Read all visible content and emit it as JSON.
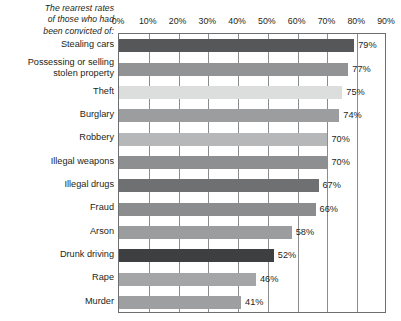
{
  "caption": {
    "line1": "The rearrest rates",
    "line2": "of those who had",
    "line3": "been convicted of:"
  },
  "chart_data": {
    "type": "bar",
    "orientation": "horizontal",
    "title": "The rearrest rates of those who had been convicted of:",
    "xlabel": "",
    "ylabel": "",
    "xlim": [
      0,
      90
    ],
    "xticks": [
      "0%",
      "10%",
      "20%",
      "30%",
      "40%",
      "50%",
      "60%",
      "70%",
      "80%",
      "90%"
    ],
    "xtick_values": [
      0,
      10,
      20,
      30,
      40,
      50,
      60,
      70,
      80,
      90
    ],
    "grid": true,
    "legend": "none",
    "categories": [
      "Stealing cars",
      "Possessing or selling stolen property",
      "Theft",
      "Burglary",
      "Robbery",
      "Illegal weapons",
      "Illegal drugs",
      "Fraud",
      "Arson",
      "Drunk driving",
      "Rape",
      "Murder"
    ],
    "values": [
      79,
      77,
      75,
      74,
      70,
      70,
      67,
      66,
      58,
      52,
      46,
      41
    ],
    "value_labels": [
      "79%",
      "77%",
      "75%",
      "74%",
      "70%",
      "70%",
      "67%",
      "66%",
      "58%",
      "52%",
      "46%",
      "41%"
    ],
    "bars": [
      {
        "label": "Stealing cars",
        "label_lines": [
          "Stealing cars"
        ],
        "value": 79,
        "value_label": "79%",
        "color": "#555759"
      },
      {
        "label": "Possessing or selling stolen property",
        "label_lines": [
          "Possessing or selling",
          "stolen property"
        ],
        "value": 77,
        "value_label": "77%",
        "color": "#919395"
      },
      {
        "label": "Theft",
        "label_lines": [
          "Theft"
        ],
        "value": 75,
        "value_label": "75%",
        "color": "#dcdddd"
      },
      {
        "label": "Burglary",
        "label_lines": [
          "Burglary"
        ],
        "value": 74,
        "value_label": "74%",
        "color": "#9b9d9f"
      },
      {
        "label": "Robbery",
        "label_lines": [
          "Robbery"
        ],
        "value": 70,
        "value_label": "70%",
        "color": "#b5b7b9"
      },
      {
        "label": "Illegal weapons",
        "label_lines": [
          "Illegal weapons"
        ],
        "value": 70,
        "value_label": "70%",
        "color": "#8d8f91"
      },
      {
        "label": "Illegal drugs",
        "label_lines": [
          "Illegal drugs"
        ],
        "value": 67,
        "value_label": "67%",
        "color": "#6e7072"
      },
      {
        "label": "Fraud",
        "label_lines": [
          "Fraud"
        ],
        "value": 66,
        "value_label": "66%",
        "color": "#8a8c8e"
      },
      {
        "label": "Arson",
        "label_lines": [
          "Arson"
        ],
        "value": 58,
        "value_label": "58%",
        "color": "#9a9c9e"
      },
      {
        "label": "Drunk driving",
        "label_lines": [
          "Drunk driving"
        ],
        "value": 52,
        "value_label": "52%",
        "color": "#3d3f41"
      },
      {
        "label": "Rape",
        "label_lines": [
          "Rape"
        ],
        "value": 46,
        "value_label": "46%",
        "color": "#a3a5a7"
      },
      {
        "label": "Murder",
        "label_lines": [
          "Murder"
        ],
        "value": 41,
        "value_label": "41%",
        "color": "#9d9fa1"
      }
    ]
  }
}
